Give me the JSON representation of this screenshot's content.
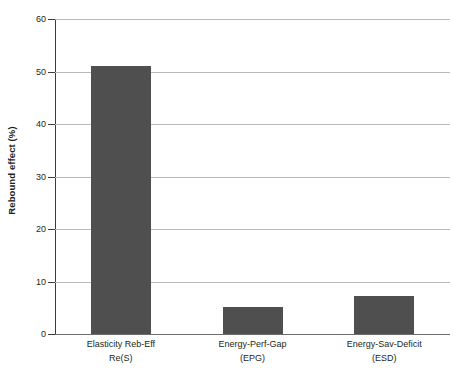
{
  "chart_data": {
    "type": "bar",
    "title": "",
    "subtitle": "",
    "xlabel": "",
    "ylabel": "Rebound effect (%)",
    "ylim": [
      0,
      60
    ],
    "yticks": [
      0,
      10,
      20,
      30,
      40,
      50,
      60
    ],
    "ytick_labels": [
      "0",
      "10",
      "20",
      "30",
      "40",
      "50",
      "60"
    ],
    "grid": true,
    "legend": false,
    "legend_position": "none",
    "bar_color": "#4f4f4f",
    "gridline_color": "#b9b9b9",
    "axis_color": "#3b3b3b",
    "categories": [
      "Elasticity Reb-Eff Re(S)",
      "Energy-Perf-Gap (EPG)",
      "Energy-Sav-Deficit (ESD)"
    ],
    "category_lines": [
      {
        "line1": "Elasticity Reb-Eff",
        "line2": "Re(S)"
      },
      {
        "line1": "Energy-Perf-Gap",
        "line2": "(EPG)"
      },
      {
        "line1": "Energy-Sav-Deficit",
        "line2": "(ESD)"
      }
    ],
    "values": [
      51,
      5.1,
      7.2
    ],
    "series": [
      {
        "name": "Rebound effect",
        "values": [
          51,
          5.1,
          7.2
        ]
      }
    ]
  }
}
